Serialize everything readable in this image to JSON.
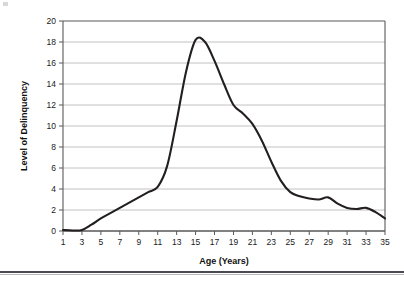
{
  "figure": {
    "name": "delinquency-age-curve",
    "background_color": "#ffffff",
    "line_color": "#231f20",
    "grid_color": "#b3b3b3",
    "axis_color": "#595959",
    "text_color": "#1a1a1a"
  },
  "chart_data": {
    "type": "line",
    "title": "",
    "xlabel": "Age (Years)",
    "ylabel": "Level of Delinquency",
    "xlim": [
      1,
      35
    ],
    "ylim": [
      0,
      20
    ],
    "grid": true,
    "legend": false,
    "x_ticks": [
      1,
      3,
      5,
      7,
      9,
      11,
      13,
      15,
      17,
      19,
      21,
      23,
      25,
      27,
      29,
      31,
      33,
      35
    ],
    "y_ticks": [
      0,
      2,
      4,
      6,
      8,
      10,
      12,
      14,
      16,
      18,
      20
    ],
    "x_tick_labels": [
      "1",
      "3",
      "5",
      "7",
      "9",
      "11",
      "13",
      "15",
      "17",
      "19",
      "21",
      "23",
      "25",
      "27",
      "29",
      "31",
      "33",
      "35"
    ],
    "y_tick_labels": [
      "0",
      "2",
      "4",
      "6",
      "8",
      "10",
      "12",
      "14",
      "16",
      "18",
      "20"
    ],
    "series": [
      {
        "name": "Level of Delinquency",
        "x": [
          1,
          2,
          3,
          4,
          5,
          6,
          7,
          8,
          9,
          10,
          11,
          12,
          13,
          14,
          15,
          16,
          17,
          18,
          19,
          20,
          21,
          22,
          23,
          24,
          25,
          26,
          27,
          28,
          29,
          30,
          31,
          32,
          33,
          34,
          35
        ],
        "values": [
          0.1,
          0.05,
          0.1,
          0.6,
          1.2,
          1.7,
          2.2,
          2.7,
          3.2,
          3.7,
          4.2,
          6.2,
          10.5,
          15.2,
          18.2,
          18.0,
          16.2,
          14.0,
          12.0,
          11.2,
          10.2,
          8.6,
          6.6,
          4.8,
          3.7,
          3.3,
          3.1,
          3.0,
          3.2,
          2.6,
          2.2,
          2.1,
          2.2,
          1.8,
          1.2
        ]
      }
    ],
    "peak": {
      "x": 15.3,
      "y": 18.3
    }
  },
  "axes": {
    "y_axis_title": "Level of Delinquency",
    "x_axis_title": "Age (Years)"
  }
}
